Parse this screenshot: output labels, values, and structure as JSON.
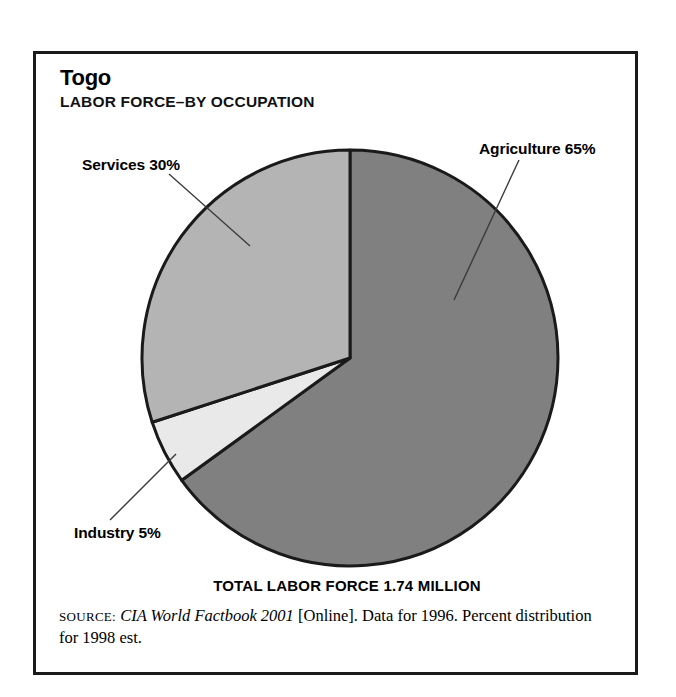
{
  "figure": {
    "title": "Togo",
    "subtitle": "LABOR FORCE–BY OCCUPATION",
    "total_caption": "TOTAL LABOR FORCE 1.74 MILLION"
  },
  "source": {
    "label": "SOURCE:",
    "publication": "CIA World Factbook 2001",
    "detail": " [Online]. Data for 1996. Percent distribution for 1998 est."
  },
  "labels": {
    "agriculture": "Agriculture 65%",
    "services": "Services 30%",
    "industry": "Industry 5%"
  },
  "colors": {
    "agriculture": "#808080",
    "industry": "#e9e9e9",
    "services": "#b4b4b4",
    "outline": "#1a1a1a",
    "leader": "#3a3a3a",
    "frame": "#1a1a1a",
    "background": "#ffffff"
  },
  "chart_data": {
    "type": "pie",
    "subtitle": "TOTAL LABOR FORCE 1.74 MILLION",
    "categories": [
      "Agriculture",
      "Industry",
      "Services"
    ],
    "values": [
      65,
      5,
      30
    ],
    "value_unit": "percent",
    "labels": [
      "Agriculture 65%",
      "Industry 5%",
      "Services 30%"
    ],
    "colors": [
      "#808080",
      "#e9e9e9",
      "#b4b4b4"
    ],
    "start_angle_deg": 0,
    "direction": "clockwise",
    "total_labor_force": "1.74 million",
    "legend": "none-inline-labels-with-leader-lines",
    "grid": false,
    "annotations": [
      "TOTAL LABOR FORCE 1.74 MILLION",
      "SOURCE: CIA World Factbook 2001 [Online]. Data for 1996. Percent distribution for 1998 est."
    ]
  }
}
